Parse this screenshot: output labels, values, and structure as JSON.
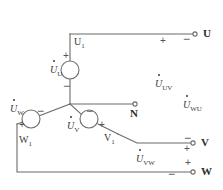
{
  "diagram": {
    "line_color": "#6b6b6b",
    "text_color": "#3a3a3a"
  },
  "terminals": [
    {
      "id": "U",
      "label": "U"
    },
    {
      "id": "N",
      "label": "N"
    },
    {
      "id": "V",
      "label": "V"
    },
    {
      "id": "W",
      "label": "W"
    }
  ],
  "winding_nodes": [
    {
      "id": "U1",
      "letter": "U",
      "sub": "1"
    },
    {
      "id": "W1",
      "letter": "W",
      "sub": "1"
    },
    {
      "id": "V1",
      "letter": "V",
      "sub": "1"
    }
  ],
  "sources": [
    {
      "id": "UU",
      "letter": "U",
      "sub": "U",
      "plus": "+",
      "minus": "−"
    },
    {
      "id": "UW",
      "letter": "U",
      "sub": "W",
      "plus": "+",
      "minus": "−"
    },
    {
      "id": "UV",
      "letter": "U",
      "sub": "V",
      "plus": "+",
      "minus": "−"
    }
  ],
  "line_voltages": [
    {
      "id": "UUV",
      "letter": "U",
      "sub": "UV"
    },
    {
      "id": "UWU",
      "letter": "U",
      "sub": "WU"
    },
    {
      "id": "UVW",
      "letter": "U",
      "sub": "VW"
    }
  ],
  "polarity_marks": {
    "u_line_plus": "+",
    "u_line_minus": "−",
    "v_line_minus": "−",
    "v_line_plus": "+",
    "w_line_plus": "+",
    "w_line_minus": "−",
    "src_u_plus": "+",
    "src_u_minus": "−",
    "src_w_minus": "−",
    "src_w_plus": "+",
    "src_v_minus": "−",
    "src_v_plus": "+"
  }
}
